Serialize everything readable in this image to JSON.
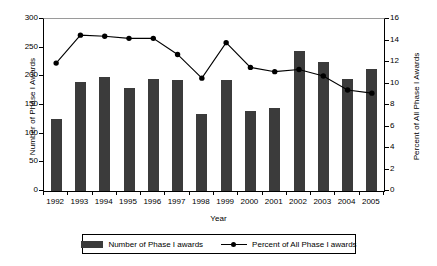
{
  "chart_data": {
    "type": "bar",
    "title": "",
    "xlabel": "Year",
    "ylabel": "Number of Phase I Awards",
    "y2label": "Percent of All Phase I Awards",
    "grid": false,
    "legend_position": "bottom",
    "ylim": [
      0,
      300
    ],
    "y2lim": [
      0,
      16
    ],
    "yticks": [
      0,
      50,
      100,
      150,
      200,
      250,
      300
    ],
    "y2ticks": [
      0,
      2,
      4,
      6,
      8,
      10,
      12,
      14,
      16
    ],
    "categories": [
      "1992",
      "1993",
      "1994",
      "1995",
      "1996",
      "1997",
      "1998",
      "1999",
      "2000",
      "2001",
      "2002",
      "2003",
      "2004",
      "2005"
    ],
    "series": [
      {
        "name": "Number of Phase I awards",
        "kind": "bar",
        "axis": "left",
        "color": "#3b3b3b",
        "values": [
          126,
          190,
          198,
          179,
          196,
          194,
          135,
          193,
          140,
          145,
          245,
          225,
          195,
          212
        ]
      },
      {
        "name": "Percent of All Phase I awards",
        "kind": "line",
        "axis": "right",
        "color": "#000000",
        "values": [
          11.9,
          14.5,
          14.4,
          14.2,
          14.2,
          12.7,
          10.5,
          13.8,
          11.5,
          11.1,
          11.3,
          10.7,
          9.4,
          9.1
        ]
      }
    ]
  },
  "axes": {
    "left_title": "Number of Phase I Awards",
    "right_title": "Percent of All Phase I Awards",
    "x_title": "Year"
  },
  "legend": {
    "items": [
      {
        "label": "Number of Phase I awards",
        "marker": "bar-swatch"
      },
      {
        "label": "Percent of All Phase I awards",
        "marker": "line-marker"
      }
    ]
  }
}
